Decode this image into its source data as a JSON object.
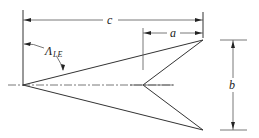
{
  "diagram": {
    "labels": {
      "chord": "c",
      "notch_length": "a",
      "span": "b",
      "sweep_symbol": "Λ",
      "sweep_subscript": "LE"
    },
    "colors": {
      "line": "#333333",
      "background": "#ffffff"
    }
  }
}
